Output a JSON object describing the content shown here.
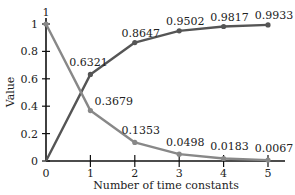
{
  "chart_data": {
    "type": "line",
    "title": "",
    "xlabel": "Number of time constants",
    "ylabel": "Value",
    "x": [
      0,
      1,
      2,
      3,
      4,
      5
    ],
    "xticks": [
      "0",
      "1",
      "2",
      "3",
      "4",
      "5"
    ],
    "yticks": [
      "0",
      "0.2",
      "0.4",
      "0.6",
      "0.8",
      "1"
    ],
    "xlim": [
      0,
      5.4
    ],
    "ylim": [
      0,
      1
    ],
    "grid": false,
    "legend": null,
    "series": [
      {
        "name": "Rising (1 - e^-t)",
        "color": "#555555",
        "values": [
          0,
          0.6321,
          0.8647,
          0.9502,
          0.9817,
          0.9933
        ],
        "labels": [
          "",
          "0.6321",
          "0.8647",
          "0.9502",
          "0.9817",
          "0.9933"
        ]
      },
      {
        "name": "Decaying (e^-t)",
        "color": "#888888",
        "values": [
          1,
          0.3679,
          0.1353,
          0.0498,
          0.0183,
          0.0067
        ],
        "labels": [
          "1",
          "0.3679",
          "0.1353",
          "0.0498",
          "0.0183",
          "0.0067"
        ]
      }
    ]
  }
}
